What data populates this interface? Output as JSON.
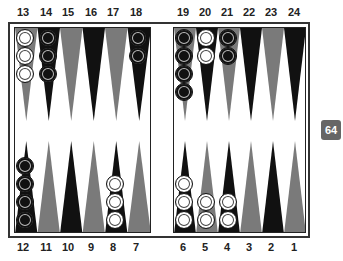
{
  "board": {
    "top_labels": [
      "13",
      "14",
      "15",
      "16",
      "17",
      "18",
      "19",
      "20",
      "21",
      "22",
      "23",
      "24"
    ],
    "bottom_labels": [
      "12",
      "11",
      "10",
      "9",
      "8",
      "7",
      "6",
      "5",
      "4",
      "3",
      "2",
      "1"
    ],
    "point_colors": {
      "dark": "#111111",
      "light": "#7a7a7a"
    },
    "points": [
      {
        "point": 13,
        "checkers": 3,
        "color": "white"
      },
      {
        "point": 14,
        "checkers": 3,
        "color": "black"
      },
      {
        "point": 15,
        "checkers": 0,
        "color": ""
      },
      {
        "point": 16,
        "checkers": 0,
        "color": ""
      },
      {
        "point": 17,
        "checkers": 0,
        "color": ""
      },
      {
        "point": 18,
        "checkers": 2,
        "color": "black"
      },
      {
        "point": 19,
        "checkers": 4,
        "color": "black"
      },
      {
        "point": 20,
        "checkers": 2,
        "color": "white"
      },
      {
        "point": 21,
        "checkers": 2,
        "color": "black"
      },
      {
        "point": 22,
        "checkers": 0,
        "color": ""
      },
      {
        "point": 23,
        "checkers": 0,
        "color": ""
      },
      {
        "point": 24,
        "checkers": 0,
        "color": ""
      },
      {
        "point": 12,
        "checkers": 4,
        "color": "black"
      },
      {
        "point": 11,
        "checkers": 0,
        "color": ""
      },
      {
        "point": 10,
        "checkers": 0,
        "color": ""
      },
      {
        "point": 9,
        "checkers": 0,
        "color": ""
      },
      {
        "point": 8,
        "checkers": 3,
        "color": "white"
      },
      {
        "point": 7,
        "checkers": 0,
        "color": ""
      },
      {
        "point": 6,
        "checkers": 3,
        "color": "white"
      },
      {
        "point": 5,
        "checkers": 2,
        "color": "white"
      },
      {
        "point": 4,
        "checkers": 2,
        "color": "white"
      },
      {
        "point": 3,
        "checkers": 0,
        "color": ""
      },
      {
        "point": 2,
        "checkers": 0,
        "color": ""
      },
      {
        "point": 1,
        "checkers": 0,
        "color": ""
      }
    ]
  },
  "doubling_cube": {
    "value": "64"
  }
}
